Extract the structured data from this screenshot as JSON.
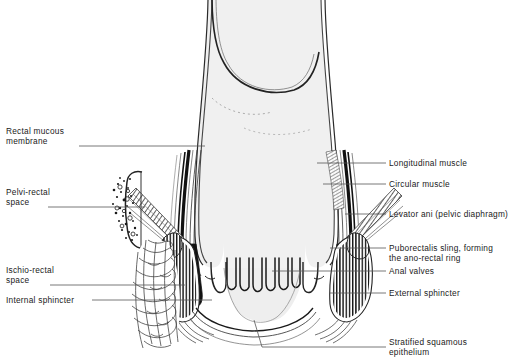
{
  "figure": {
    "type": "anatomical-line-diagram",
    "colors": {
      "background": "#ffffff",
      "lumen_fill": "#f0f0f0",
      "lumen_fill_deep": "#e8e8e8",
      "outline": "#1a1a1a",
      "muscle_black": "#111111",
      "hatch": "#333333",
      "leader": "#555555",
      "text": "#1a1a1a"
    }
  },
  "labels_left": [
    {
      "id": "rectal-mucous-membrane",
      "lines": [
        "Rectal mucous",
        "membrane"
      ],
      "text": "Rectal mucous membrane",
      "x": 6,
      "y": 126,
      "leader_y": 146,
      "leader_x1": 79,
      "leader_x2": 205
    },
    {
      "id": "pelvi-rectal-space",
      "lines": [
        "Pelvi-rectal",
        "space"
      ],
      "text": "Pelvi-rectal space",
      "x": 6,
      "y": 187,
      "leader_y": 207,
      "leader_x1": 48,
      "leader_x2": 145
    },
    {
      "id": "ischio-rectal-space",
      "lines": [
        "Ischio-rectal",
        "space"
      ],
      "text": "Ischio-rectal space",
      "x": 6,
      "y": 265,
      "leader_y": 285,
      "leader_x1": 50,
      "leader_x2": 185
    },
    {
      "id": "internal-sphincter",
      "lines": [
        "Internal sphincter"
      ],
      "text": "Internal sphincter",
      "x": 6,
      "y": 295,
      "leader_y": 300,
      "leader_x1": 92,
      "leader_x2": 212
    }
  ],
  "labels_right": [
    {
      "id": "longitudinal-muscle",
      "lines": [
        "Longitudinal muscle"
      ],
      "text": "Longitudinal muscle",
      "x": 389,
      "y": 158,
      "leader_y": 163,
      "leader_x1": 317,
      "leader_x2": 386
    },
    {
      "id": "circular-muscle",
      "lines": [
        "Circular muscle"
      ],
      "text": "Circular muscle",
      "x": 389,
      "y": 179,
      "leader_y": 184,
      "leader_x1": 323,
      "leader_x2": 386
    },
    {
      "id": "levator-ani",
      "lines": [
        "Levator ani (pelvic diaphragm)"
      ],
      "text": "Levator ani (pelvic diaphragm)",
      "x": 389,
      "y": 209,
      "leader_y": 214,
      "leader_x1": 345,
      "leader_x2": 386
    },
    {
      "id": "puborectalis-sling",
      "lines": [
        "Puborectalis sling, forming",
        "the ano-rectal ring"
      ],
      "text": "Puborectalis sling, forming the ano-rectal ring",
      "x": 389,
      "y": 243,
      "leader_y": 248,
      "leader_x1": 330,
      "leader_x2": 386
    },
    {
      "id": "anal-valves",
      "lines": [
        "Anal valves"
      ],
      "text": "Anal valves",
      "x": 389,
      "y": 266,
      "leader_y": 271,
      "leader_x1": 272,
      "leader_x2": 386
    },
    {
      "id": "external-sphincter",
      "lines": [
        "External sphincter"
      ],
      "text": "External sphincter",
      "x": 389,
      "y": 288,
      "leader_y": 293,
      "leader_x1": 330,
      "leader_x2": 386
    },
    {
      "id": "stratified-squamous-epithelium",
      "lines": [
        "Stratified squamous",
        "epithelium"
      ],
      "text": "Stratified squamous epithelium",
      "x": 389,
      "y": 337,
      "leader_y": 347,
      "leader_x1": 386,
      "leader_x2": 386
    }
  ],
  "structures": [
    {
      "id": "rectum-lumen",
      "name": "rectal-ampulla"
    },
    {
      "id": "anal-canal",
      "name": "anal-canal-lumen"
    },
    {
      "id": "anal-valves-columns",
      "name": "anal-columns",
      "count": 6
    },
    {
      "id": "internal-sphincter-left",
      "name": "internal-sphincter-band-left"
    },
    {
      "id": "internal-sphincter-right",
      "name": "internal-sphincter-band-right"
    },
    {
      "id": "external-sphincter-left",
      "name": "external-sphincter-hatched-left"
    },
    {
      "id": "external-sphincter-right",
      "name": "external-sphincter-hatched-right"
    },
    {
      "id": "levator-ani-left",
      "name": "levator-ani-band-left"
    },
    {
      "id": "levator-ani-right",
      "name": "levator-ani-band-right"
    },
    {
      "id": "puborectalis-left",
      "name": "puborectalis-sling-left"
    },
    {
      "id": "puborectalis-right",
      "name": "puborectalis-sling-right"
    },
    {
      "id": "ischio-rectal-fat",
      "name": "ischio-rectal-fossa-fat"
    },
    {
      "id": "pelvi-rectal-stipple",
      "name": "pelvi-rectal-space-stipple"
    }
  ]
}
